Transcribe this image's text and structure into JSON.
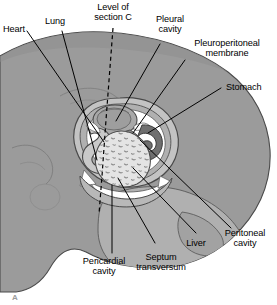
{
  "figure": {
    "panel_letter": "A",
    "caption_labels": [
      {
        "id": "heart",
        "text": "Heart"
      },
      {
        "id": "lung",
        "text": "Lung"
      },
      {
        "id": "level-of-section-c",
        "text": "Level of\nsection C"
      },
      {
        "id": "pleural-cavity",
        "text": "Pleural\ncavity"
      },
      {
        "id": "pleuroperitoneal-membrane",
        "text": "Pleuroperitoneal\nmembrane"
      },
      {
        "id": "stomach",
        "text": "Stomach"
      },
      {
        "id": "peritoneal-cavity",
        "text": "Peritoneal\ncavity"
      },
      {
        "id": "liver",
        "text": "Liver"
      },
      {
        "id": "septum-transversum",
        "text": "Septum\ntransversum"
      },
      {
        "id": "pericardial-cavity",
        "text": "Pericardial\ncavity"
      }
    ],
    "colors": {
      "background": "#ffffff",
      "body_fill": "#9b9b9b",
      "body_fill_light": "#b3b3b3",
      "body_fill_lighter": "#c4c4c4",
      "cavity_white": "#ffffff",
      "liver_fill": "#e2e2e2",
      "liver_stipple": "#8a8a8a",
      "stomach_dark": "#6e6e6e",
      "outline": "#3a3a3a",
      "leader_line": "#000000",
      "panel_letter": "#9b9b9b"
    }
  }
}
